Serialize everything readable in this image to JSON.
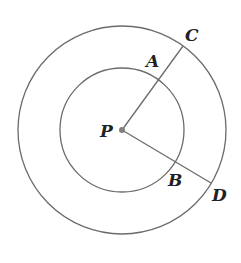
{
  "diagram": {
    "center": {
      "label": "P",
      "x": 122,
      "y": 130
    },
    "circles": [
      {
        "name": "inner",
        "r": 62
      },
      {
        "name": "outer",
        "r": 104
      }
    ],
    "points": {
      "A": {
        "label": "A",
        "x": 159,
        "y": 80,
        "label_x": 146,
        "label_y": 67
      },
      "B": {
        "label": "B",
        "x": 174,
        "y": 163,
        "label_x": 168,
        "label_y": 186
      },
      "C": {
        "label": "C",
        "x": 183,
        "y": 46,
        "label_x": 185,
        "label_y": 41
      },
      "D": {
        "label": "D",
        "x": 211,
        "y": 183,
        "label_x": 212,
        "label_y": 201
      }
    },
    "segments": [
      {
        "from": "P",
        "to": "C"
      },
      {
        "from": "P",
        "to": "D"
      }
    ],
    "colors": {
      "stroke": "#6b6b6b",
      "center_dot": "#808080",
      "text": "#222222"
    }
  }
}
